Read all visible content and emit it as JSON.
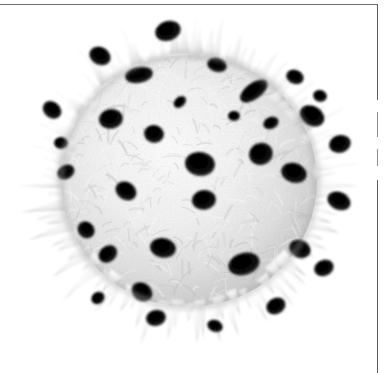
{
  "figure": {
    "domain_label": "scanning-electron-micrograph",
    "caption": "",
    "background_color": "#ffffff",
    "border_color": "#5c5c5c",
    "specimen_light_color": "#f4f4f4",
    "specimen_mid_color": "#cfcfcf",
    "specimen_shadow_color": "#8a8a8a",
    "aperture_color": "#050505"
  },
  "specimen": {
    "name": "echinate-pollen-grain",
    "alt_text": "Scanning electron micrograph of a spherical echinate pollen grain covered in radiating conical spines with dark circular pores across its surface",
    "shape": "spheroidal",
    "surface": "echinate",
    "center_x": 181,
    "center_y": 175,
    "body_radius_x": 128,
    "body_radius_y": 126,
    "spine_count": 96,
    "spine_length_min": 16,
    "spine_length_max": 46,
    "pore_count": 34
  },
  "apertures": [
    {
      "x": 160,
      "y": 25,
      "rx": 13,
      "ry": 10,
      "rot": -18
    },
    {
      "x": 92,
      "y": 50,
      "rx": 11,
      "ry": 9,
      "rot": 28
    },
    {
      "x": 131,
      "y": 69,
      "rx": 14,
      "ry": 8,
      "rot": -10
    },
    {
      "x": 209,
      "y": 59,
      "rx": 10,
      "ry": 7,
      "rot": 16
    },
    {
      "x": 246,
      "y": 85,
      "rx": 16,
      "ry": 8,
      "rot": -36
    },
    {
      "x": 287,
      "y": 71,
      "rx": 9,
      "ry": 7,
      "rot": 22
    },
    {
      "x": 44,
      "y": 104,
      "rx": 10,
      "ry": 8,
      "rot": 40
    },
    {
      "x": 103,
      "y": 113,
      "rx": 12,
      "ry": 10,
      "rot": -8
    },
    {
      "x": 146,
      "y": 128,
      "rx": 10,
      "ry": 9,
      "rot": 12
    },
    {
      "x": 263,
      "y": 117,
      "rx": 8,
      "ry": 6,
      "rot": -24
    },
    {
      "x": 304,
      "y": 110,
      "rx": 13,
      "ry": 10,
      "rot": 30
    },
    {
      "x": 332,
      "y": 138,
      "rx": 11,
      "ry": 9,
      "rot": -14
    },
    {
      "x": 192,
      "y": 158,
      "rx": 15,
      "ry": 12,
      "rot": 8
    },
    {
      "x": 253,
      "y": 148,
      "rx": 12,
      "ry": 11,
      "rot": -20
    },
    {
      "x": 286,
      "y": 167,
      "rx": 13,
      "ry": 10,
      "rot": 18
    },
    {
      "x": 196,
      "y": 194,
      "rx": 12,
      "ry": 10,
      "rot": -6
    },
    {
      "x": 118,
      "y": 185,
      "rx": 11,
      "ry": 9,
      "rot": 34
    },
    {
      "x": 58,
      "y": 166,
      "rx": 9,
      "ry": 7,
      "rot": -30
    },
    {
      "x": 331,
      "y": 195,
      "rx": 12,
      "ry": 9,
      "rot": 24
    },
    {
      "x": 78,
      "y": 224,
      "rx": 9,
      "ry": 8,
      "rot": 44
    },
    {
      "x": 100,
      "y": 248,
      "rx": 10,
      "ry": 8,
      "rot": -38
    },
    {
      "x": 155,
      "y": 242,
      "rx": 13,
      "ry": 10,
      "rot": 10
    },
    {
      "x": 236,
      "y": 258,
      "rx": 16,
      "ry": 11,
      "rot": -16
    },
    {
      "x": 292,
      "y": 243,
      "rx": 11,
      "ry": 9,
      "rot": 26
    },
    {
      "x": 316,
      "y": 262,
      "rx": 10,
      "ry": 8,
      "rot": -22
    },
    {
      "x": 134,
      "y": 286,
      "rx": 11,
      "ry": 9,
      "rot": 36
    },
    {
      "x": 148,
      "y": 312,
      "rx": 10,
      "ry": 8,
      "rot": -12
    },
    {
      "x": 207,
      "y": 320,
      "rx": 8,
      "ry": 6,
      "rot": 20
    },
    {
      "x": 268,
      "y": 300,
      "rx": 10,
      "ry": 8,
      "rot": -28
    },
    {
      "x": 53,
      "y": 137,
      "rx": 7,
      "ry": 6,
      "rot": 0
    },
    {
      "x": 226,
      "y": 110,
      "rx": 6,
      "ry": 5,
      "rot": 0
    },
    {
      "x": 172,
      "y": 96,
      "rx": 7,
      "ry": 5,
      "rot": -42
    },
    {
      "x": 312,
      "y": 90,
      "rx": 7,
      "ry": 6,
      "rot": 14
    },
    {
      "x": 90,
      "y": 292,
      "rx": 7,
      "ry": 6,
      "rot": -34
    }
  ]
}
